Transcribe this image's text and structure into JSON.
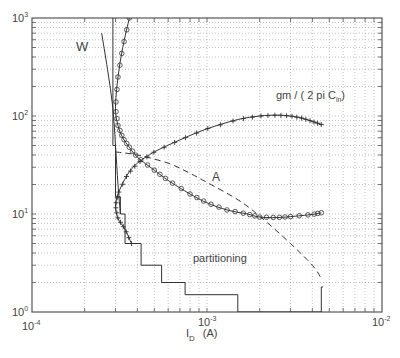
{
  "chart_data": {
    "type": "line",
    "title": "",
    "xlabel": "I_D (A)",
    "ylabel": "",
    "xscale": "log",
    "yscale": "log",
    "xlim": [
      0.0001,
      0.01
    ],
    "ylim": [
      1,
      1000
    ],
    "grid": true,
    "x_ticks": [
      "10^-4",
      "10^-3",
      "10^-2"
    ],
    "y_ticks": [
      "10^0",
      "10^1",
      "10^2",
      "10^3"
    ],
    "annotations": [
      "W",
      "gm / ( 2 pi C_in)",
      "A",
      "partitioning"
    ],
    "series": [
      {
        "name": "W",
        "marker": "none",
        "style": "solid",
        "x": [
          0.00025,
          0.00027,
          0.00029,
          0.0003,
          0.00031,
          0.00032
        ],
        "y": [
          700,
          300,
          120,
          50,
          20,
          10
        ]
      },
      {
        "name": "W (circles)",
        "marker": "o",
        "style": "solid",
        "x": [
          0.00036,
          0.00033,
          0.00031,
          0.0003,
          0.00031,
          0.00033,
          0.00036,
          0.0004,
          0.0005,
          0.0006,
          0.0008,
          0.001,
          0.0013,
          0.0017,
          0.002,
          0.0025,
          0.003,
          0.004,
          0.0045
        ],
        "y": [
          1000,
          500,
          250,
          120,
          80,
          60,
          48,
          38,
          28,
          22,
          16,
          13,
          11,
          10,
          9.3,
          9.2,
          9.4,
          9.9,
          10.3
        ]
      },
      {
        "name": "gm / ( 2 pi C_in)",
        "marker": "+",
        "style": "solid",
        "x": [
          0.00037,
          0.00034,
          0.00031,
          0.0003,
          0.00031,
          0.00035,
          0.0004,
          0.0005,
          0.0007,
          0.001,
          0.0015,
          0.002,
          0.0025,
          0.003,
          0.0035,
          0.004,
          0.0045
        ],
        "y": [
          5,
          7,
          9,
          12,
          16,
          25,
          33,
          43,
          57,
          74,
          92,
          100,
          102,
          100,
          95,
          88,
          82
        ]
      },
      {
        "name": "A",
        "marker": "none",
        "style": "dashed",
        "x": [
          0.0003,
          0.0004,
          0.0006,
          0.0008,
          0.001,
          0.0015,
          0.002,
          0.003,
          0.004,
          0.0045
        ],
        "y": [
          43,
          40,
          33,
          26,
          21,
          14,
          9.5,
          5,
          3,
          2.2
        ]
      },
      {
        "name": "partitioning",
        "marker": "none",
        "style": "step",
        "x": [
          0.00029,
          0.00029,
          0.0003,
          0.0003,
          0.00032,
          0.00032,
          0.00034,
          0.00034,
          0.00042,
          0.00042,
          0.00055,
          0.00055,
          0.00075,
          0.00075,
          0.0015,
          0.0015,
          0.0045,
          0.0045,
          0.0046
        ],
        "y": [
          1000,
          50,
          50,
          15,
          15,
          10,
          10,
          5,
          5,
          3,
          3,
          2,
          2,
          1.5,
          1.5,
          1,
          1,
          1.8,
          1.8
        ]
      }
    ]
  },
  "labels": {
    "y_ticks": [
      {
        "base": "10",
        "exp": "3"
      },
      {
        "base": "10",
        "exp": "2"
      },
      {
        "base": "10",
        "exp": "1"
      },
      {
        "base": "10",
        "exp": "0"
      }
    ],
    "x_ticks": [
      {
        "base": "10",
        "exp": "-4"
      },
      {
        "base": "10",
        "exp": "-3"
      },
      {
        "base": "10",
        "exp": "-2"
      }
    ],
    "xlabel_main": "I",
    "xlabel_sub": "D",
    "xlabel_unit": "(A)",
    "w_label": "W",
    "gm_label_main": "gm / ( 2 pi C",
    "gm_label_sub": "in",
    "gm_label_close": ")",
    "a_label": "A",
    "partitioning_label": "partitioning"
  },
  "colors": {
    "axis": "#555555",
    "grid": "#999999",
    "line": "#333333",
    "text": "#444444"
  }
}
